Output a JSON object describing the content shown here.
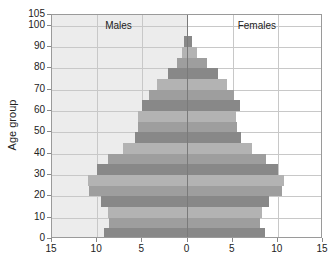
{
  "chart_data": {
    "type": "bar",
    "orientation": "horizontal-pyramid",
    "title": "",
    "xlabel": "",
    "ylabel": "Age group",
    "panel_labels": {
      "left": "Males",
      "right": "Females"
    },
    "x_ticks": [
      "15",
      "10",
      "5",
      "0",
      "5",
      "10",
      "15"
    ],
    "x_range": [
      -15,
      15
    ],
    "y_ticks": [
      "0",
      "10",
      "20",
      "30",
      "40",
      "50",
      "60",
      "70",
      "80",
      "90",
      "100",
      "105"
    ],
    "y_range": [
      0,
      105
    ],
    "grid": true,
    "categories": [
      "0-4",
      "5-9",
      "10-14",
      "15-19",
      "20-24",
      "25-29",
      "30-34",
      "35-39",
      "40-44",
      "45-49",
      "50-54",
      "55-59",
      "60-64",
      "65-69",
      "70-74",
      "75-79",
      "80-84",
      "85-89",
      "90-94"
    ],
    "series": [
      {
        "name": "Males",
        "values": [
          9.2,
          8.7,
          8.8,
          9.6,
          10.9,
          11.0,
          10.0,
          8.8,
          7.1,
          5.8,
          5.5,
          5.5,
          5.0,
          4.3,
          3.4,
          2.2,
          1.2,
          0.6,
          0.4
        ]
      },
      {
        "name": "Females",
        "values": [
          8.6,
          8.0,
          8.3,
          9.0,
          10.5,
          10.7,
          10.0,
          8.7,
          7.1,
          5.9,
          5.5,
          5.4,
          5.8,
          5.2,
          4.4,
          3.4,
          2.2,
          1.0,
          0.5
        ]
      }
    ],
    "bar_shades": [
      "#888888",
      "#9e9e9e",
      "#b3b3b3"
    ],
    "colors": {
      "male_background": "#ececec",
      "female_background": "#ffffff",
      "gridline": "#c8c8c8"
    }
  }
}
